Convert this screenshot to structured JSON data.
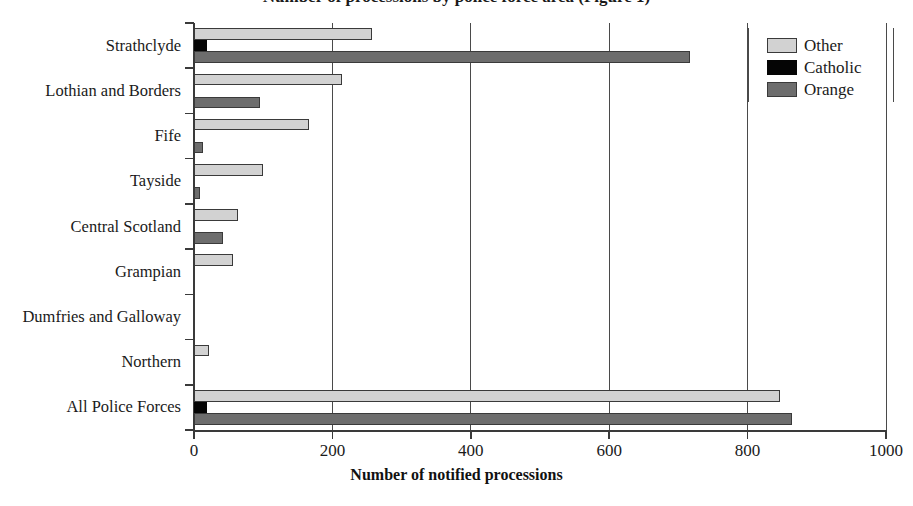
{
  "chart_data": {
    "type": "bar",
    "orientation": "horizontal",
    "title": "Number of processions by police force area (Figure 1)",
    "title_clipped": true,
    "xlabel": "Number of notified processions",
    "ylabel": "",
    "xlim": [
      0,
      1000
    ],
    "xticks": [
      0,
      200,
      400,
      600,
      800,
      1000
    ],
    "xtick_labels": [
      "0",
      "200",
      "400",
      "600",
      "800",
      "1000"
    ],
    "grid": "vertical",
    "legend_position": "top-right",
    "categories": [
      "Strathclyde",
      "Lothian and Borders",
      "Fife",
      "Tayside",
      "Central Scotland",
      "Grampian",
      "Dumfries and Galloway",
      "Northern",
      "All Police Forces"
    ],
    "series": [
      {
        "name": "Other",
        "color": "#d2d2d2",
        "values": [
          257,
          214,
          166,
          99,
          64,
          57,
          0,
          22,
          847
        ]
      },
      {
        "name": "Catholic",
        "color": "#050505",
        "values": [
          19,
          0,
          0,
          0,
          0,
          0,
          0,
          0,
          19
        ]
      },
      {
        "name": "Orange",
        "color": "#6d6d6d",
        "values": [
          717,
          95,
          13,
          9,
          42,
          0,
          0,
          0,
          864
        ]
      }
    ]
  },
  "legend": {
    "entries": [
      {
        "label": "Other",
        "swatch": "other"
      },
      {
        "label": "Catholic",
        "swatch": "catholic"
      },
      {
        "label": "Orange",
        "swatch": "orange"
      }
    ]
  }
}
